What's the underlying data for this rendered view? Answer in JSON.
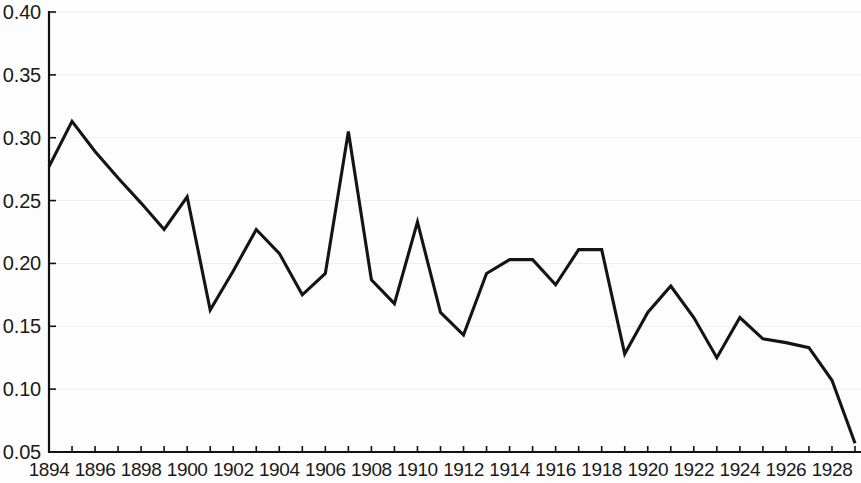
{
  "chart_data": {
    "type": "line",
    "title": "",
    "subtitle": "",
    "xlabel": "",
    "ylabel": "",
    "xlim": [
      1894,
      1929
    ],
    "ylim": [
      0.05,
      0.4
    ],
    "grid": true,
    "legend": null,
    "x_tick_labels": [
      "1894",
      "1896",
      "1898",
      "1900",
      "1902",
      "1904",
      "1906",
      "1908",
      "1910",
      "1912",
      "1914",
      "1916",
      "1918",
      "1920",
      "1922",
      "1924",
      "1926",
      "1928"
    ],
    "x_tick_values": [
      1894,
      1896,
      1898,
      1900,
      1902,
      1904,
      1906,
      1908,
      1910,
      1912,
      1914,
      1916,
      1918,
      1920,
      1922,
      1924,
      1926,
      1928
    ],
    "x_minor_ticks": [
      1895,
      1897,
      1899,
      1901,
      1903,
      1905,
      1907,
      1909,
      1911,
      1913,
      1915,
      1917,
      1919,
      1921,
      1923,
      1925,
      1927,
      1929
    ],
    "y_tick_labels": [
      "0.40",
      "0.35",
      "0.30",
      "0.25",
      "0.20",
      "0.15",
      "0.10",
      "0.05"
    ],
    "y_tick_values": [
      0.4,
      0.35,
      0.3,
      0.25,
      0.2,
      0.15,
      0.1,
      0.05
    ],
    "line_color": "#141414",
    "x": [
      1894,
      1895,
      1896,
      1897,
      1898,
      1899,
      1900,
      1901,
      1902,
      1903,
      1904,
      1905,
      1906,
      1907,
      1908,
      1909,
      1910,
      1911,
      1912,
      1913,
      1914,
      1915,
      1916,
      1917,
      1918,
      1919,
      1920,
      1921,
      1922,
      1923,
      1924,
      1925,
      1926,
      1927,
      1928,
      1929
    ],
    "values": [
      0.277,
      0.313,
      0.289,
      0.268,
      0.248,
      0.227,
      0.253,
      0.163,
      0.194,
      0.227,
      0.208,
      0.175,
      0.192,
      0.305,
      0.187,
      0.168,
      0.233,
      0.161,
      0.143,
      0.192,
      0.203,
      0.203,
      0.183,
      0.211,
      0.211,
      0.128,
      0.161,
      0.182,
      0.157,
      0.125,
      0.157,
      0.14,
      0.137,
      0.133,
      0.107,
      0.057
    ]
  }
}
